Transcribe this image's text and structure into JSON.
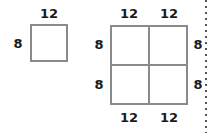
{
  "figure": {
    "type": "geometry-diagram",
    "background_color": "#ffffff",
    "line_color": "#8a8a8a",
    "text_color": "#1a1a1a",
    "rule_color": "#555555",
    "small_square": {
      "top_label": "12",
      "left_label": "8"
    },
    "large_square": {
      "top_left_label": "12",
      "top_right_label": "12",
      "bottom_left_label": "12",
      "bottom_right_label": "12",
      "left_top_label": "8",
      "left_bottom_label": "8",
      "right_top_label": "8",
      "right_bottom_label": "8"
    }
  }
}
